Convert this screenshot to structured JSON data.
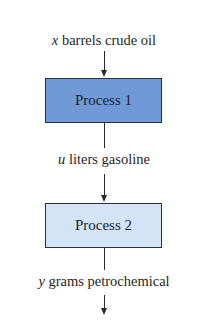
{
  "diagram": {
    "type": "flowchart",
    "input": {
      "variable": "x",
      "text": " barrels crude oil"
    },
    "nodes": [
      {
        "id": "process1",
        "label": "Process 1",
        "fill": "#6f9ad6"
      },
      {
        "id": "process2",
        "label": "Process 2",
        "fill": "#d2e4f5"
      }
    ],
    "intermediate": {
      "variable": "u",
      "text": " liters gasoline"
    },
    "output": {
      "variable": "y",
      "text": " grams petrochemical"
    },
    "edges": [
      {
        "from": "input",
        "to": "process1"
      },
      {
        "from": "process1",
        "to": "process2",
        "label": "u liters gasoline"
      },
      {
        "from": "process2",
        "to": "output",
        "label": "y grams petrochemical"
      }
    ]
  }
}
